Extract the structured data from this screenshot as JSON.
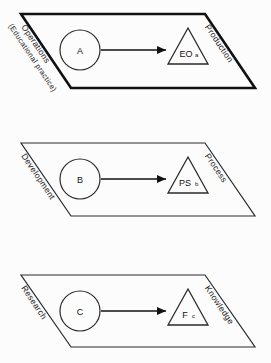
{
  "figure": {
    "background_color": "#fcfcfc",
    "stroke_color": "#111111"
  },
  "panels": [
    {
      "id": "production-level",
      "emphasis": "bold",
      "left_label_line1": "Operations",
      "left_label_line2": "(Educational practice)",
      "right_label": "Production",
      "source_node": "A",
      "target_node_base": "EO",
      "target_node_sub": "a"
    },
    {
      "id": "process-level",
      "emphasis": "normal",
      "left_label_line1": "Development",
      "left_label_line2": "",
      "right_label": "Process",
      "source_node": "B",
      "target_node_base": "PS",
      "target_node_sub": "b"
    },
    {
      "id": "knowledge-level",
      "emphasis": "normal",
      "left_label_line1": "Research",
      "left_label_line2": "",
      "right_label": "Knowledge",
      "source_node": "C",
      "target_node_base": "F",
      "target_node_sub": "c"
    }
  ]
}
